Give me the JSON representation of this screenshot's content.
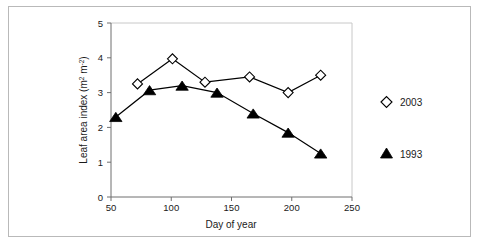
{
  "chart_data": {
    "type": "line",
    "title": "",
    "xlabel": "Day of year",
    "ylabel_plain": "Leaf area index (m2 m-2)",
    "ylabel_parts": {
      "main": "Leaf area index (m",
      "sup1": "2",
      "mid": " m",
      "sup2": "-2",
      "tail": ")"
    },
    "xlim": [
      50,
      250
    ],
    "ylim": [
      0,
      5
    ],
    "xticks": [
      50,
      100,
      150,
      200,
      250
    ],
    "yticks": [
      0,
      1,
      2,
      3,
      4,
      5
    ],
    "grid": false,
    "legend_position": "right",
    "series": [
      {
        "name": "2003",
        "marker": "open-diamond",
        "x": [
          72,
          101,
          128,
          165,
          197,
          224
        ],
        "y": [
          3.25,
          3.97,
          3.3,
          3.45,
          3.0,
          3.5
        ]
      },
      {
        "name": "1993",
        "marker": "filled-triangle",
        "x": [
          54,
          82,
          109,
          138,
          168,
          197,
          224
        ],
        "y": [
          2.3,
          3.07,
          3.2,
          3.0,
          2.4,
          1.85,
          1.25
        ]
      }
    ],
    "colors": {
      "line": "#000000",
      "axis": "#6f6f6f",
      "frame": "#c8c8c8",
      "text": "#1a1a1a",
      "background": "#ffffff"
    }
  },
  "legend": {
    "entries": [
      {
        "label": "2003",
        "marker": "open-diamond"
      },
      {
        "label": "1993",
        "marker": "filled-triangle"
      }
    ]
  },
  "axis": {
    "x_tick_labels": [
      "50",
      "100",
      "150",
      "200",
      "250"
    ],
    "y_tick_labels": [
      "0",
      "1",
      "2",
      "3",
      "4",
      "5"
    ]
  }
}
